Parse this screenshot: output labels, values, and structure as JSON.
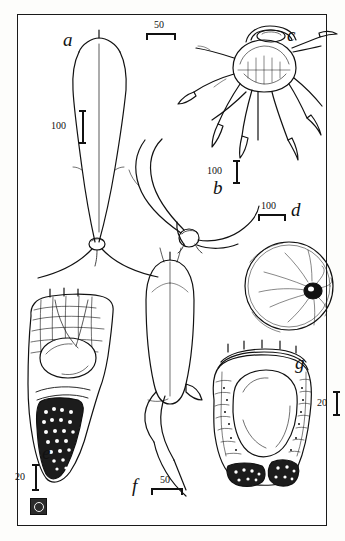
{
  "plate": {
    "title": "Zooplankton morphology plate",
    "panels": [
      {
        "id": "a",
        "label": "a"
      },
      {
        "id": "b",
        "label": "b"
      },
      {
        "id": "c",
        "label": "c"
      },
      {
        "id": "d",
        "label": "d"
      },
      {
        "id": "e",
        "label": "e"
      },
      {
        "id": "f",
        "label": "f"
      },
      {
        "id": "g",
        "label": "g"
      }
    ],
    "scale_bars": [
      {
        "id": "scale-c",
        "value": "50",
        "orientation": "horizontal",
        "panel": "c"
      },
      {
        "id": "scale-a",
        "value": "100",
        "orientation": "vertical",
        "panel": "a"
      },
      {
        "id": "scale-b",
        "value": "100",
        "orientation": "vertical",
        "panel": "b"
      },
      {
        "id": "scale-d",
        "value": "100",
        "orientation": "horizontal",
        "panel": "d"
      },
      {
        "id": "scale-e",
        "value": "20",
        "orientation": "vertical",
        "panel": "e"
      },
      {
        "id": "scale-f",
        "value": "50",
        "orientation": "horizontal",
        "panel": "f"
      },
      {
        "id": "scale-g",
        "value": "20",
        "orientation": "vertical",
        "panel": "g"
      }
    ],
    "colors": {
      "ink": "#111111",
      "paper": "#ffffff",
      "border": "#1a1a1a"
    }
  }
}
